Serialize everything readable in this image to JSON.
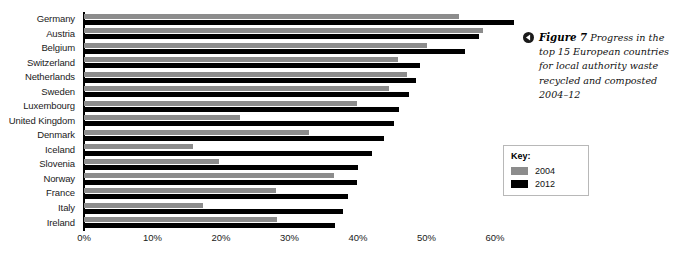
{
  "chart_data": {
    "type": "bar",
    "orientation": "horizontal",
    "title": "",
    "xlabel": "",
    "ylabel": "",
    "xlim": [
      0,
      65
    ],
    "grid": false,
    "legend_position": "right-inside-box",
    "categories": [
      "Germany",
      "Austria",
      "Belgium",
      "Switzerland",
      "Netherlands",
      "Sweden",
      "Luxembourg",
      "United Kingdom",
      "Denmark",
      "Iceland",
      "Slovenia",
      "Norway",
      "France",
      "Italy",
      "Ireland"
    ],
    "series": [
      {
        "name": "2004",
        "color": "#8c8c8c",
        "values": [
          54.7,
          58.2,
          50.1,
          45.8,
          47.2,
          44.5,
          39.9,
          22.8,
          32.9,
          15.9,
          19.7,
          36.5,
          28.0,
          17.3,
          28.2
        ]
      },
      {
        "name": "2012",
        "color": "#000000",
        "values": [
          62.8,
          57.7,
          55.6,
          49.0,
          48.5,
          47.5,
          46.0,
          45.2,
          43.8,
          42.1,
          40.0,
          39.8,
          38.6,
          37.8,
          36.6
        ]
      }
    ],
    "xticks": [
      0,
      10,
      20,
      30,
      40,
      50,
      60
    ],
    "xtick_labels": [
      "0%",
      "10%",
      "20%",
      "30%",
      "40%",
      "50%",
      "60%"
    ]
  },
  "key": {
    "title": "Key:",
    "items": [
      {
        "label": "2004",
        "color": "#8c8c8c"
      },
      {
        "label": "2012",
        "color": "#000000"
      }
    ]
  },
  "caption": {
    "marker_icon": "left-triangle-icon",
    "figure_number": "Figure 7",
    "text": "Progress in the top 15 European countries for local authority waste recycled and composted 2004–12"
  }
}
